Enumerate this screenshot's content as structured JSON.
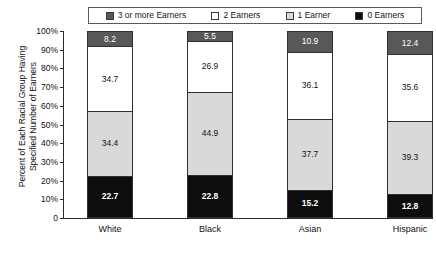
{
  "chart_data": {
    "type": "bar",
    "subtype": "stacked-100-percent",
    "title": "",
    "xlabel": "",
    "ylabel": "Percent of Each Racial Group Having Specified Number of Earners",
    "ylabel_lines": [
      "Percent of Each Racial Group Having",
      "Specified Number of Earners"
    ],
    "ylim": [
      0,
      100
    ],
    "y_ticks": [
      "0",
      "10%",
      "20%",
      "30%",
      "40%",
      "50%",
      "60%",
      "70%",
      "80%",
      "90%",
      "100%"
    ],
    "y_tick_values": [
      0,
      10,
      20,
      30,
      40,
      50,
      60,
      70,
      80,
      90,
      100
    ],
    "grid": false,
    "legend_position": "top",
    "categories": [
      "White",
      "Black",
      "Asian",
      "Hispanic"
    ],
    "stack_order_bottom_to_top": [
      "0 Earners",
      "1 Earner",
      "2 Earners",
      "3 or more Earners"
    ],
    "series": [
      {
        "name": "0 Earners",
        "color": "#0d0d0d",
        "values": [
          22.7,
          22.8,
          15.2,
          12.8
        ]
      },
      {
        "name": "1 Earner",
        "color": "#d9d9d9",
        "values": [
          34.4,
          44.9,
          37.7,
          39.3
        ]
      },
      {
        "name": "2 Earners",
        "color": "#ffffff",
        "values": [
          34.7,
          26.9,
          36.1,
          35.6
        ]
      },
      {
        "name": "3 or more Earners",
        "color": "#585858",
        "values": [
          8.2,
          5.5,
          10.9,
          12.4
        ]
      }
    ]
  },
  "legend": {
    "items": [
      {
        "label": "3 or more Earners",
        "color": "#585858"
      },
      {
        "label": "2 Earners",
        "color": "#ffffff"
      },
      {
        "label": "1 Earner",
        "color": "#d9d9d9"
      },
      {
        "label": "0 Earners",
        "color": "#0d0d0d"
      }
    ]
  }
}
